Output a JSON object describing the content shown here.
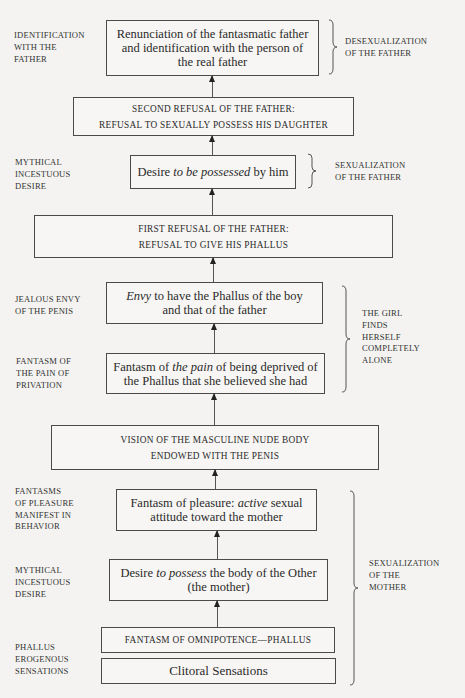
{
  "diagram": {
    "boxes": [
      {
        "id": "renunciation",
        "lines": [
          "Renunciation of the fantasmatic father",
          "and identification with the person of",
          "the real father"
        ]
      },
      {
        "id": "second-refusal",
        "lines": [
          "SECOND REFUSAL OF THE FATHER:",
          "REFUSAL TO SEXUALLY POSSESS HIS DAUGHTER"
        ]
      },
      {
        "id": "desire-possessed",
        "pre": "Desire ",
        "em": "to be possessed",
        "post": " by him"
      },
      {
        "id": "first-refusal",
        "lines": [
          "FIRST REFUSAL OF THE FATHER:",
          "REFUSAL TO GIVE HIS PHALLUS"
        ]
      },
      {
        "id": "envy",
        "em": "Envy",
        "post": " to have the Phallus of the boy",
        "line2": "and that of the father"
      },
      {
        "id": "fantasm-pain",
        "pre": "Fantasm of ",
        "em": "the pain",
        "post": " of being deprived of",
        "line2": "the Phallus that she believed she had"
      },
      {
        "id": "vision",
        "lines": [
          "VISION OF THE MASCULINE NUDE BODY",
          "ENDOWED WITH THE PENIS"
        ]
      },
      {
        "id": "fantasm-pleasure",
        "pre": "Fantasm of pleasure: ",
        "em": "active",
        "post": " sexual",
        "line2": "attitude toward the mother"
      },
      {
        "id": "desire-possess",
        "pre": "Desire ",
        "em": "to possess",
        "post": " the body of the Other",
        "line2": "(the mother)"
      },
      {
        "id": "omnipotence",
        "lines": [
          "FANTASM OF OMNIPOTENCE—PHALLUS"
        ]
      },
      {
        "id": "clitoral",
        "lines": [
          "Clitoral Sensations"
        ]
      }
    ],
    "left_labels": [
      {
        "id": "identification",
        "lines": [
          "IDENTIFICATION",
          "WITH THE",
          "FATHER"
        ]
      },
      {
        "id": "mythical-1",
        "lines": [
          "MYTHICAL",
          "INCESTUOUS",
          "DESIRE"
        ]
      },
      {
        "id": "jealous-envy",
        "lines": [
          "JEALOUS ENVY",
          "OF THE PENIS"
        ]
      },
      {
        "id": "fantasm-privation",
        "lines": [
          "FANTASM OF",
          "THE PAIN OF",
          "PRIVATION"
        ]
      },
      {
        "id": "fantasms-pleasure",
        "lines": [
          "FANTASMS",
          "OF PLEASURE",
          "MANIFEST IN",
          "BEHAVIOR"
        ]
      },
      {
        "id": "mythical-2",
        "lines": [
          "MYTHICAL",
          "INCESTUOUS",
          "DESIRE"
        ]
      },
      {
        "id": "phallus-erogenous",
        "lines": [
          "PHALLUS",
          "EROGENOUS",
          "SENSATIONS"
        ]
      }
    ],
    "right_labels": [
      {
        "id": "desexualization",
        "lines": [
          "DESEXUALIZATION",
          "OF THE FATHER"
        ]
      },
      {
        "id": "sexualization-father",
        "lines": [
          "SEXUALIZATION",
          "OF THE FATHER"
        ]
      },
      {
        "id": "girl-alone",
        "lines": [
          "THE GIRL",
          "FINDS",
          "HERSELF",
          "COMPLETELY",
          "ALONE"
        ]
      },
      {
        "id": "sexualization-mother",
        "lines": [
          "SEXUALIZATION",
          "OF THE",
          "MOTHER"
        ]
      }
    ]
  }
}
